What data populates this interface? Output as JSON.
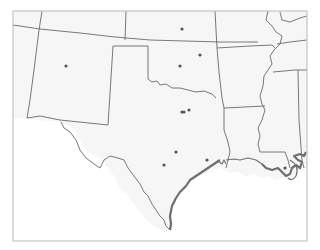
{
  "map": {
    "region": "South Central United States",
    "colors": {
      "land": "#f6f6f6",
      "water": "#ffffff",
      "border": "#6a6a6a",
      "frame": "#c4c4c4",
      "marker": "#555555"
    },
    "states": [
      "Colorado",
      "Kansas",
      "Missouri",
      "New Mexico",
      "Oklahoma",
      "Arkansas",
      "Texas",
      "Louisiana",
      "Mississippi",
      "Arizona"
    ],
    "markers": [
      {
        "id": "kansas-marker",
        "x": 182,
        "y": 29
      },
      {
        "id": "tulsa-marker",
        "x": 200,
        "y": 55
      },
      {
        "id": "oklahoma-city-marker",
        "x": 180,
        "y": 66
      },
      {
        "id": "albuquerque-marker",
        "x": 66,
        "y": 66
      },
      {
        "id": "dallas-marker-1",
        "x": 182,
        "y": 112
      },
      {
        "id": "dallas-marker-2",
        "x": 184,
        "y": 112
      },
      {
        "id": "fort-worth-marker",
        "x": 189,
        "y": 110
      },
      {
        "id": "austin-marker",
        "x": 176,
        "y": 152
      },
      {
        "id": "san-antonio-marker",
        "x": 164,
        "y": 165
      },
      {
        "id": "houston-marker",
        "x": 207,
        "y": 160
      },
      {
        "id": "new-orleans-marker",
        "x": 285,
        "y": 168
      }
    ]
  }
}
